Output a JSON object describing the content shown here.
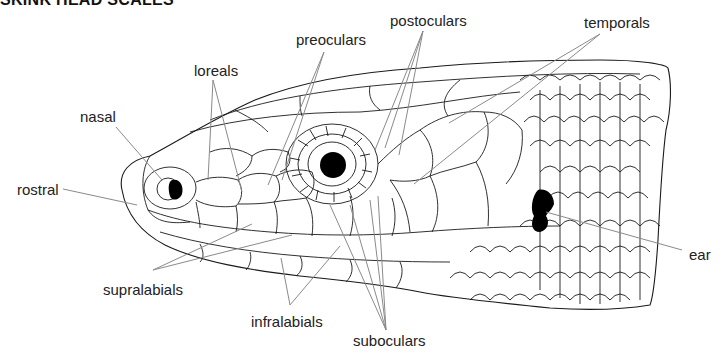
{
  "title": "SKINK HEAD SCALES",
  "diagram": {
    "colors": {
      "line": "#1a1a1a",
      "leader": "#8a8a8a",
      "fill": "#ffffff",
      "eye": "#000000"
    },
    "labels": [
      {
        "id": "nasal",
        "text": "nasal",
        "x": 80,
        "y": 108
      },
      {
        "id": "rostral",
        "text": "rostral",
        "x": 17,
        "y": 181
      },
      {
        "id": "loreals",
        "text": "loreals",
        "x": 194,
        "y": 62
      },
      {
        "id": "preoculars",
        "text": "preoculars",
        "x": 296,
        "y": 31
      },
      {
        "id": "postoculars",
        "text": "postoculars",
        "x": 390,
        "y": 12
      },
      {
        "id": "temporals",
        "text": "temporals",
        "x": 584,
        "y": 14
      },
      {
        "id": "ear",
        "text": "ear",
        "x": 689,
        "y": 246
      },
      {
        "id": "supralabials",
        "text": "supralabials",
        "x": 103,
        "y": 281
      },
      {
        "id": "infralabials",
        "text": "infralabials",
        "x": 251,
        "y": 313
      },
      {
        "id": "suboculars",
        "text": "suboculars",
        "x": 353,
        "y": 332
      }
    ]
  }
}
